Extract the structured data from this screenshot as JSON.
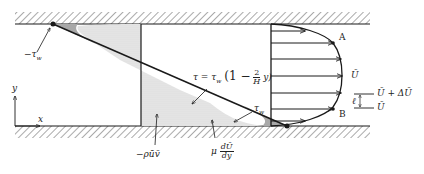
{
  "diagram": {
    "type": "turbulent channel flow shear stress and velocity profile",
    "labels": {
      "neg_tau_w": "−τ",
      "neg_tau_w_sub": "w",
      "tau_w": "τ",
      "tau_w_sub": "w",
      "tau_eq_prefix": "τ = τ",
      "tau_eq_sub": "w",
      "tau_eq_open": "(1 −",
      "tau_eq_num": "2",
      "tau_eq_den": "H",
      "tau_eq_close": "y)",
      "reynolds_stress": "−ρūv̄",
      "viscous_mu": "μ",
      "viscous_num": "dŪ",
      "viscous_den": "dy",
      "point_A": "A",
      "point_B": "B",
      "U_bar": "Ū",
      "U_plus_dU": "Ū + ΔŪ",
      "U_lower": "Ū",
      "mixing_length": "ℓ",
      "x_axis": "x",
      "y_axis": "y"
    },
    "colors": {
      "line": "#1a1a1a",
      "hatch": "#555555",
      "reynolds_fill": "#d9d9d9",
      "viscous_fill": "#a8a8a8"
    }
  }
}
